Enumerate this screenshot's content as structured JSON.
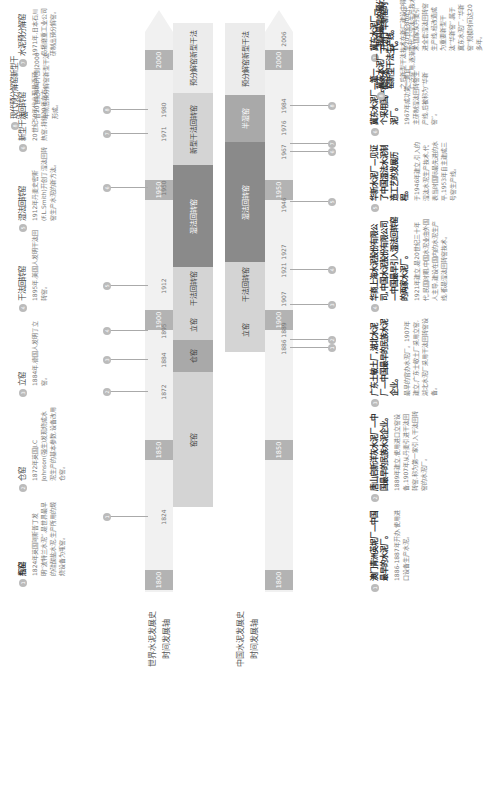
{
  "colors": {
    "track": "#f1f1f1",
    "year_block": "#b3b3b3",
    "era_light": "#d4d4d4",
    "era_mid": "#a9a9a9",
    "era_dark": "#8a8a8a",
    "marker": "#bbbbbb"
  },
  "world": {
    "axis_title_line1": "世界水泥发展史",
    "axis_title_line2": "时间发展轴",
    "year_blocks": [
      "1800",
      "1850",
      "1900",
      "1950",
      "2000"
    ],
    "tick_years": [
      "1824",
      "1872",
      "1884",
      "1895",
      "1912",
      "1950",
      "1971",
      "1980"
    ],
    "markers": [
      "1",
      "2",
      "3",
      "4",
      "5",
      "6",
      "7",
      "8"
    ],
    "eras": [
      {
        "label": "窑窑"
      },
      {
        "label": "仓窑"
      },
      {
        "label": "立窑"
      },
      {
        "label": "干法回转窑"
      },
      {
        "label": "湿法回转窑"
      },
      {
        "label": "新型干法回转窑"
      },
      {
        "label": "预分解窑新型干法"
      }
    ],
    "notes": [
      {
        "num": "1",
        "title": "瓶窑",
        "body": "1824年英国阿斯普丁发明“波特兰水泥”,是世界最早的硅酸盐水泥,生产所用的煅烧设备为瓶窑。"
      },
      {
        "num": "2",
        "title": "仓窑",
        "body": "1872年英国J.C Johnson(强生)发现烧成水泥生产的基本参数,设备改用仓窑。"
      },
      {
        "num": "3",
        "title": "立窑",
        "body": "1884年,德国人发明了立窑。"
      },
      {
        "num": "4",
        "title": "干法回转窑",
        "body": "1895年,美国人发明干法回转窑。"
      },
      {
        "num": "5",
        "title": "湿法回转窑",
        "body": "1912年丹麦史密斯(F.L.Smith)开创了湿法回转窑生产水泥的新方法。"
      },
      {
        "num": "6",
        "title": "新型干法回转窑",
        "body": "20世纪50年代出现悬浮预热窑,持续20年左右。"
      },
      {
        "num": "7",
        "title": "水泥预分解窑",
        "body": "1971年,日本石川岛播磨重工业公司研制出预分解窑。"
      },
      {
        "num": "8",
        "title": "现代预分解窑新型干法",
        "body": "自20世纪80年代到2000年前后预分解窑新型干法形成。"
      }
    ]
  },
  "china": {
    "axis_title_line1": "中国水泥发展史",
    "axis_title_line2": "时间发展轴",
    "year_blocks": [
      "1800",
      "1850",
      "1900",
      "1950",
      "2000"
    ],
    "tick_years": [
      "1886",
      "1889",
      "1907",
      "1921",
      "1927",
      "1946",
      "1967",
      "1976",
      "1984",
      "2006"
    ],
    "markers": [
      "1",
      "2",
      "3",
      "4",
      "5",
      "6",
      "7",
      "8"
    ],
    "eras": [
      {
        "label": "立窑"
      },
      {
        "label": "干法回转窑"
      },
      {
        "label": "湿法回转窑"
      },
      {
        "label": "半湿窑"
      },
      {
        "label": "预分解窑新型干法"
      }
    ],
    "notes": [
      {
        "num": "1",
        "title": "澳门青洲英坭厂—中国最早的水泥厂。",
        "body": "1886-1887年开办,使用进口设备生产水泥。"
      },
      {
        "num": "2",
        "title": "唐山启新洋灰水泥厂—中国最早的民族水泥企业。",
        "body": "1889年建立,使用进口立窑设备,1907年从丹麦引进干法回转窑,称为第一家引入干法回转窑的水泥厂。"
      },
      {
        "num": "3",
        "title": "广东土敏土厂,湖北水泥厂—中国最早的民族水泥企业。",
        "body": "最早的官办水泥厂。1907年建立,广东士敏土厂采用立窑,湖北水泥厂采用干法回转窑设备。"
      },
      {
        "num": "4",
        "title": "华商上海水泥股份有限公司,中国水泥股份有限公司—中国最早引入湿法回转窑的两家水泥厂。",
        "body": "1921年建立,是20世纪三十年代,民国时期,中国水泥业由外国人主导,建设在国内的水泥生产线,都是湿法回转窑技术。"
      },
      {
        "num": "5",
        "title": "华新水泥厂—见证了中国湿法水泥制造工艺的发展历程。",
        "body": "于1946年建立,引入的湿法水泥生产技术,代表当时国际最先进的水平,1953年自主建成三号窑生产线。"
      },
      {
        "num": "6",
        "title": "冀东水泥厂—第一个采用国产窑的水泥厂。",
        "body": "1967年成功第一条自主研制湿法回转窑生产线,后被称为“华新窑”。"
      },
      {
        "num": "7",
        "title": "冀东水泥厂—开创了华新窑时代。",
        "body": "至20世纪80年代末,国家从丹麦引进全套湿法回转窑生产线,经改造成为重要新型干法“华新窑”,属于冀东水泥厂,“华新窑”规模时间达20多年。"
      },
      {
        "num": "8",
        "title": "冀东水泥厂—我国最早的预分解窑新型干法生产线。",
        "body": "之后新型干法技术在新厂建设中得到广泛应用,逐渐取代了湿法生产技术。"
      }
    ]
  }
}
